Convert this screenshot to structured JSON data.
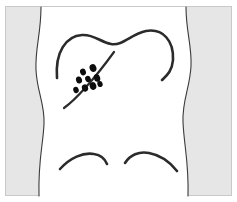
{
  "figure": {
    "kind": "medical-illustration",
    "caption": "",
    "colors": {
      "page_background": "#ffffff",
      "panel_background": "#e6e6e6",
      "body_fill": "#ffffff",
      "body_outline": "#3a3a3a",
      "anatomy_line": "#2b2b2b",
      "lesion_fill": "#0d0d0d",
      "frame_border": "#c9c9c9"
    },
    "panel": {
      "x": 5,
      "y": 6,
      "width": 227,
      "height": 190,
      "border_width": 1
    },
    "torso": {
      "label": "torso-silhouette",
      "left_edge_path": "M 41 7 C 41 34, 35 48, 36 70 C 37 92, 45 104, 44 124 C 43 146, 38 160, 39 196",
      "right_edge_path": "M 186 7 C 186 32, 192 46, 191 66 C 190 88, 182 100, 183 122 C 184 146, 189 162, 188 196",
      "fill_region_path": "M 41 7 C 41 34, 35 48, 36 70 C 37 92, 45 104, 44 124 C 43 146, 38 160, 39 196 L 188 196 C 189 162, 184 146, 183 122 C 182 100, 190 88, 191 66 C 192 46, 186 32, 186 7 Z",
      "outline_width": 1.1
    },
    "anatomy_lines": [
      {
        "name": "shoulder-and-upper-back-contour",
        "path": "M 57 78 C 55 52, 66 36, 82 35 C 94 34, 100 42, 111 44 C 123 46, 131 34, 146 31 C 163 28, 174 41, 173 60 C 172 72, 166 76, 162 80",
        "stroke_width": 2.6
      },
      {
        "name": "scapula-flank-diagonal-line",
        "path": "M 114 52 C 106 63, 96 76, 86 87 C 78 96, 71 103, 64 108",
        "stroke_width": 2.2
      },
      {
        "name": "left-gluteal-fold-curve",
        "path": "M 60 169 C 70 158, 83 152, 94 154 C 101 155, 105 159, 107 164",
        "stroke_width": 2.6
      },
      {
        "name": "right-gluteal-fold-curve",
        "path": "M 125 163 C 130 155, 139 151, 149 153 C 160 155, 170 162, 177 171",
        "stroke_width": 2.6
      }
    ],
    "lesion_cluster": {
      "name": "lesion-cluster",
      "count": 9,
      "description": "cluster of dark dermal lesions",
      "lesions": [
        {
          "cx": 83,
          "cy": 72,
          "rx": 2.9,
          "ry": 3.4,
          "rotate": -20
        },
        {
          "cx": 93,
          "cy": 68,
          "rx": 3.4,
          "ry": 4.0,
          "rotate": -18
        },
        {
          "cx": 79,
          "cy": 80,
          "rx": 3.0,
          "ry": 3.5,
          "rotate": -15
        },
        {
          "cx": 88,
          "cy": 79,
          "rx": 2.8,
          "ry": 3.3,
          "rotate": -22
        },
        {
          "cx": 97,
          "cy": 78,
          "rx": 3.2,
          "ry": 3.8,
          "rotate": -15
        },
        {
          "cx": 76,
          "cy": 90,
          "rx": 2.7,
          "ry": 3.2,
          "rotate": -20
        },
        {
          "cx": 85,
          "cy": 88,
          "rx": 3.1,
          "ry": 3.6,
          "rotate": -18
        },
        {
          "cx": 93,
          "cy": 86,
          "rx": 3.3,
          "ry": 3.9,
          "rotate": -16
        },
        {
          "cx": 100,
          "cy": 84,
          "rx": 2.6,
          "ry": 3.1,
          "rotate": -20
        }
      ]
    }
  }
}
